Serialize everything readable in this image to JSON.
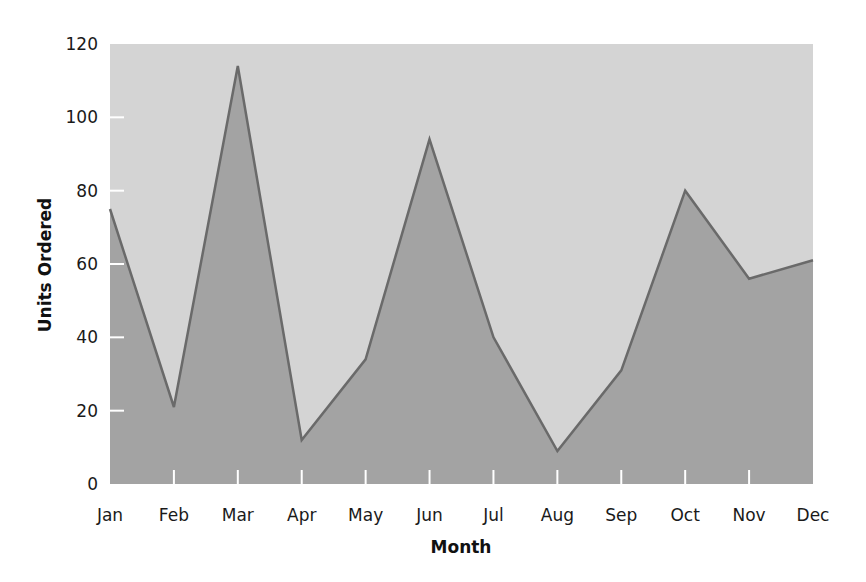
{
  "chart_data": {
    "type": "area",
    "title": "",
    "xlabel": "Month",
    "ylabel": "Units Ordered",
    "categories": [
      "Jan",
      "Feb",
      "Mar",
      "Apr",
      "May",
      "Jun",
      "Jul",
      "Aug",
      "Sep",
      "Oct",
      "Nov",
      "Dec"
    ],
    "series": [
      {
        "name": "Units Ordered",
        "values": [
          75,
          21,
          114,
          12,
          34,
          94,
          40,
          9,
          31,
          80,
          56,
          61
        ]
      }
    ],
    "ylim": [
      0,
      120
    ],
    "yticks": [
      0,
      20,
      40,
      60,
      80,
      100,
      120
    ],
    "grid": false,
    "legend": "none"
  },
  "colors": {
    "plot_background": "#d4d4d4",
    "area_fill": "#a3a3a3",
    "line": "#6a6a6a",
    "tick_mark": "#ffffff"
  }
}
